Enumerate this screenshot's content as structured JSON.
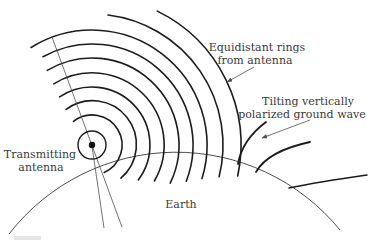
{
  "figure": {
    "labels": {
      "equidistant_line1": "Equidistant rings",
      "equidistant_line2": "from antenna",
      "tilting_line1": "Tilting vertically",
      "tilting_line2": "polarized ground wave",
      "transmitting_line1": "Transmitting",
      "transmitting_line2": "antenna",
      "earth": "Earth"
    },
    "colors": {
      "ink": "#1c1c1c",
      "thin_line": "#4f4f4f",
      "text": "#3a3a3a",
      "paper": "#ffffff"
    },
    "geometry": {
      "canvas": {
        "width": 374,
        "height": 240
      },
      "antenna_center": {
        "x": 92,
        "y": 145
      },
      "antenna_dot_radius": 3.2,
      "antenna_circle_radius": 14,
      "rings": [
        {
          "r": 30,
          "start": 128,
          "end": -66
        },
        {
          "r": 44,
          "start": 126,
          "end": -49
        },
        {
          "r": 58,
          "start": 124,
          "end": -37
        },
        {
          "r": 72,
          "start": 122,
          "end": -30
        },
        {
          "r": 87,
          "start": 121,
          "end": -26
        },
        {
          "r": 101,
          "start": 119,
          "end": -21
        },
        {
          "r": 115,
          "start": 122,
          "end": -17
        },
        {
          "r": 131,
          "start": 83,
          "end": -14
        },
        {
          "r": 149,
          "start": 64,
          "end": -12
        }
      ],
      "earth_arc": {
        "x1": 9,
        "y1": 234,
        "r": 211.6,
        "x2": 340,
        "y2": 230
      },
      "radial_line": {
        "x1": 52,
        "y1": 37,
        "x2": 122,
        "y2": 227
      },
      "beam_line": {
        "x1": 92,
        "y1": 146,
        "x2": 104,
        "y2": 228
      },
      "ground_wave_strokes": [
        {
          "from": [
            238,
            164
          ],
          "ctrl": [
            242,
            140
          ],
          "to": [
            266,
            122
          ],
          "flat": false
        },
        {
          "from": [
            256,
            172
          ],
          "ctrl": [
            268,
            151
          ],
          "to": [
            310,
            142
          ],
          "flat": false
        },
        {
          "from": [
            289,
            188
          ],
          "ctrl": [
            318,
            182
          ],
          "to": [
            367,
            175
          ],
          "flat": true
        }
      ],
      "leader_arrows": [
        {
          "from": [
            254,
            67
          ],
          "to": [
            227,
            82
          ]
        },
        {
          "from": [
            310,
            120
          ],
          "to": [
            262,
            138
          ]
        }
      ],
      "caption_remnant": {
        "x": 14,
        "y": 236,
        "w": 27,
        "h": 4
      }
    }
  }
}
